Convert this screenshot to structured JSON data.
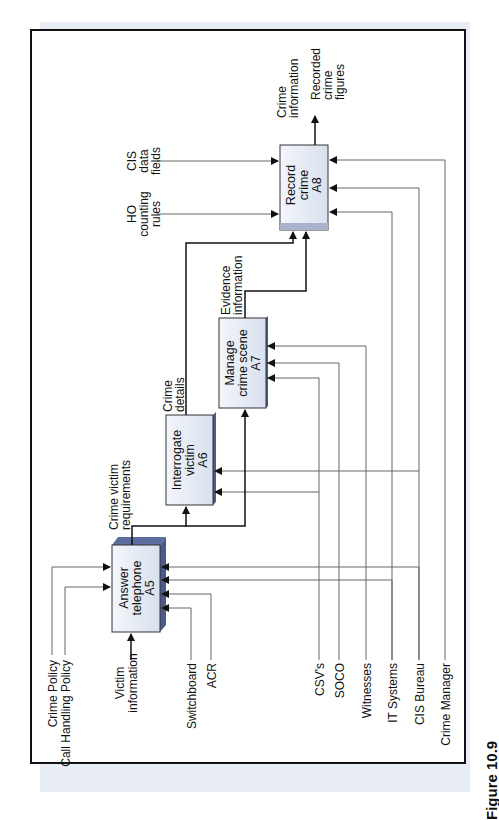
{
  "figure": {
    "caption": "Figure 10.9"
  },
  "boxes": {
    "a5": {
      "line1": "Answer",
      "line2": "telephone",
      "line3": "A5"
    },
    "a6": {
      "line1": "Interrogate",
      "line2": "victim",
      "line3": "A6"
    },
    "a7": {
      "line1": "Manage",
      "line2": "crime scene",
      "line3": "A7"
    },
    "a8": {
      "line1": "Record",
      "line2": "crime",
      "line3": "A8"
    }
  },
  "controls": {
    "crime_policy": "Crime Policy",
    "call_handling_policy": "Call Handling Policy",
    "ho_counting_rules": {
      "line1": "HO",
      "line2": "counting",
      "line3": "rules"
    },
    "cis_data_fields": {
      "line1": "CIS",
      "line2": "data",
      "line3": "fields"
    }
  },
  "inputs": {
    "victim_information": {
      "line1": "Victim",
      "line2": "information"
    }
  },
  "flows": {
    "crime_victim_requirements": {
      "line1": "Crime victim",
      "line2": "requirements"
    },
    "crime_details": {
      "line1": "Crime",
      "line2": "details"
    },
    "evidence_information": {
      "line1": "Evidence",
      "line2": "information"
    },
    "crime_information": {
      "line1": "Crime",
      "line2": "information"
    }
  },
  "outputs": {
    "recorded_crime_figures": {
      "line1": "Recorded",
      "line2": "crime",
      "line3": "figures"
    }
  },
  "mechanisms": {
    "switchboard": "Switchboard",
    "acr": "ACR",
    "csvs": "CSV's",
    "soco": "SOCO",
    "witnesses": "Witnesses",
    "it_systems": "IT Systems",
    "cis_bureau": "CIS Bureau",
    "crime_manager": "Crime Manager"
  },
  "colors": {
    "box_fill": "#e8eef7",
    "box_side": "#4a5a8c",
    "line_dark": "#111111",
    "line_gray": "#666666"
  }
}
